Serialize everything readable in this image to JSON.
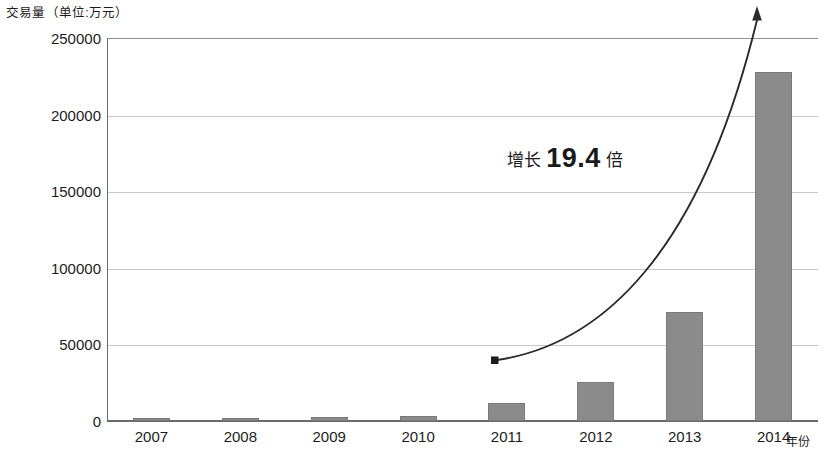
{
  "chart_data": {
    "type": "bar",
    "title": "",
    "ylabel": "交易量（单位:万元）",
    "xlabel": "年份",
    "categories": [
      "2007",
      "2008",
      "2009",
      "2010",
      "2011",
      "2012",
      "2013",
      "2014"
    ],
    "values": [
      1800,
      2000,
      2600,
      3600,
      11800,
      25500,
      71000,
      228000
    ],
    "ylim": [
      0,
      250000
    ],
    "ytick_labels": [
      "0",
      "50000",
      "100000",
      "150000",
      "200000",
      "250000"
    ],
    "ytick_values": [
      0,
      50000,
      100000,
      150000,
      200000,
      250000
    ],
    "grid": true,
    "legend": "none",
    "series": [
      {
        "name": "交易量",
        "values": [
          1800,
          2000,
          2600,
          3600,
          11800,
          25500,
          71000,
          228000
        ]
      }
    ],
    "annotations": [
      {
        "name": "growth-callout",
        "prefix": "增长",
        "value": "19.4",
        "suffix": "倍",
        "full_text": "增长 19.4 倍"
      },
      {
        "name": "growth-arrow",
        "kind": "curved-arrow",
        "from": "2011",
        "to": "2014"
      }
    ],
    "colors": {
      "bar_fill": "#8b8b8b",
      "bar_stroke": "#7a7a7a",
      "gridline": "#c9c9c9",
      "axis": "#6a6a6a",
      "text": "#1c1c1c",
      "arrow": "#2b2b2b"
    }
  },
  "axis": {
    "y_unit_caption": "交易量（单位:万元）",
    "x_name": "年份"
  }
}
